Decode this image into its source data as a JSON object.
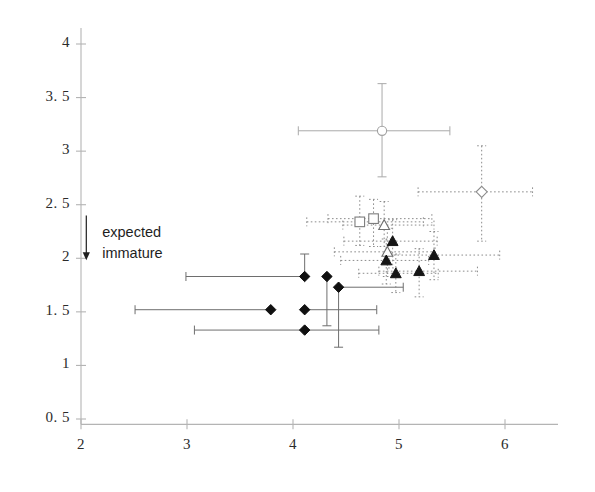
{
  "chart_data": {
    "type": "scatter",
    "title": "",
    "xlabel": "",
    "ylabel": "",
    "xlim": [
      2,
      6.5
    ],
    "ylim": [
      0.45,
      4.15
    ],
    "xticks": [
      2,
      3,
      4,
      5,
      6
    ],
    "yticks": [
      0.5,
      1,
      1.5,
      2,
      2.5,
      3,
      3.5,
      4
    ],
    "xtick_labels": [
      "2",
      "3",
      "4",
      "5",
      "6"
    ],
    "ytick_labels": [
      "0. 5",
      "1",
      "1. 5",
      "2",
      "2. 5",
      "3",
      "3. 5",
      "4"
    ],
    "grid": false,
    "legend": "none",
    "annotations": [
      {
        "name": "expected-immature",
        "line1": "expected",
        "line2": "immature",
        "arrow": "down-arrow",
        "arrow_x": 2.05,
        "arrow_y_top": 2.4,
        "arrow_y_bottom": 2.0,
        "text_x": 2.2,
        "text_y": 2.32
      }
    ],
    "series": [
      {
        "name": "filled-diamond",
        "marker": "diamond",
        "fill": "#101010",
        "errorbar_style": "solid",
        "errorbar_color": "#6e6e6e",
        "points": [
          {
            "x": 4.11,
            "y": 1.83,
            "xerr_lo": 1.12,
            "xerr_hi": 0.0,
            "yerr_lo": 0.0,
            "yerr_hi": 0.21
          },
          {
            "x": 4.32,
            "y": 1.83,
            "xerr_lo": 0.0,
            "xerr_hi": 0.0,
            "yerr_lo": 0.46,
            "yerr_hi": 0.0
          },
          {
            "x": 4.43,
            "y": 1.73,
            "xerr_lo": 0.0,
            "xerr_hi": 0.61,
            "yerr_lo": 0.56,
            "yerr_hi": 0.0
          },
          {
            "x": 3.79,
            "y": 1.52,
            "xerr_lo": 1.28,
            "xerr_hi": 0.0,
            "yerr_lo": 0.0,
            "yerr_hi": 0.0
          },
          {
            "x": 4.11,
            "y": 1.52,
            "xerr_lo": 0.0,
            "xerr_hi": 0.68,
            "yerr_lo": 0.0,
            "yerr_hi": 0.0
          },
          {
            "x": 4.11,
            "y": 1.33,
            "xerr_lo": 1.04,
            "xerr_hi": 0.7,
            "yerr_lo": 0.0,
            "yerr_hi": 0.0
          }
        ]
      },
      {
        "name": "open-circle",
        "marker": "circle",
        "fill": "none",
        "errorbar_style": "solid",
        "errorbar_color": "#a9a9a9",
        "points": [
          {
            "x": 4.84,
            "y": 3.19,
            "xerr_lo": 0.79,
            "xerr_hi": 0.64,
            "yerr_lo": 0.43,
            "yerr_hi": 0.44
          }
        ]
      },
      {
        "name": "open-diamond",
        "marker": "diamond-open",
        "fill": "none",
        "errorbar_style": "dotted",
        "errorbar_color": "#8c8c8c",
        "points": [
          {
            "x": 5.78,
            "y": 2.62,
            "xerr_lo": 0.6,
            "xerr_hi": 0.48,
            "yerr_lo": 0.46,
            "yerr_hi": 0.43
          }
        ]
      },
      {
        "name": "open-square",
        "marker": "square-open",
        "fill": "none",
        "errorbar_style": "dotted",
        "errorbar_color": "#8c8c8c",
        "points": [
          {
            "x": 4.63,
            "y": 2.34,
            "xerr_lo": 0.5,
            "xerr_hi": 0.6,
            "yerr_lo": 0.22,
            "yerr_hi": 0.24
          },
          {
            "x": 4.76,
            "y": 2.37,
            "xerr_lo": 0.43,
            "xerr_hi": 0.55,
            "yerr_lo": 0.26,
            "yerr_hi": 0.18
          }
        ]
      },
      {
        "name": "open-triangle",
        "marker": "triangle-open",
        "fill": "none",
        "errorbar_style": "dotted",
        "errorbar_color": "#8c8c8c",
        "points": [
          {
            "x": 4.86,
            "y": 2.31,
            "xerr_lo": 0.39,
            "xerr_hi": 0.47,
            "yerr_lo": 0.2,
            "yerr_hi": 0.22
          },
          {
            "x": 4.89,
            "y": 2.06,
            "xerr_lo": 0.5,
            "xerr_hi": 0.45,
            "yerr_lo": 0.23,
            "yerr_hi": 0.22
          }
        ]
      },
      {
        "name": "filled-triangle",
        "marker": "triangle",
        "fill": "#151515",
        "errorbar_style": "dotted",
        "errorbar_color": "#8c8c8c",
        "points": [
          {
            "x": 4.94,
            "y": 2.16,
            "xerr_lo": 0.46,
            "xerr_hi": 0.42,
            "yerr_lo": 0.25,
            "yerr_hi": 0.2
          },
          {
            "x": 4.88,
            "y": 1.98,
            "xerr_lo": 0.43,
            "xerr_hi": 0.4,
            "yerr_lo": 0.22,
            "yerr_hi": 0.2
          },
          {
            "x": 5.19,
            "y": 1.88,
            "xerr_lo": 0.38,
            "xerr_hi": 0.55,
            "yerr_lo": 0.24,
            "yerr_hi": 0.21
          },
          {
            "x": 5.33,
            "y": 2.03,
            "xerr_lo": 0.42,
            "xerr_hi": 0.62,
            "yerr_lo": 0.23,
            "yerr_hi": 0.22
          },
          {
            "x": 4.97,
            "y": 1.86,
            "xerr_lo": 0.35,
            "xerr_hi": 0.4,
            "yerr_lo": 0.18,
            "yerr_hi": 0.18
          }
        ]
      }
    ]
  },
  "axes": {
    "axis_color": "#b4b4b4",
    "tick_color": "#b4b4b4",
    "label_color": "#2b2b2b"
  }
}
